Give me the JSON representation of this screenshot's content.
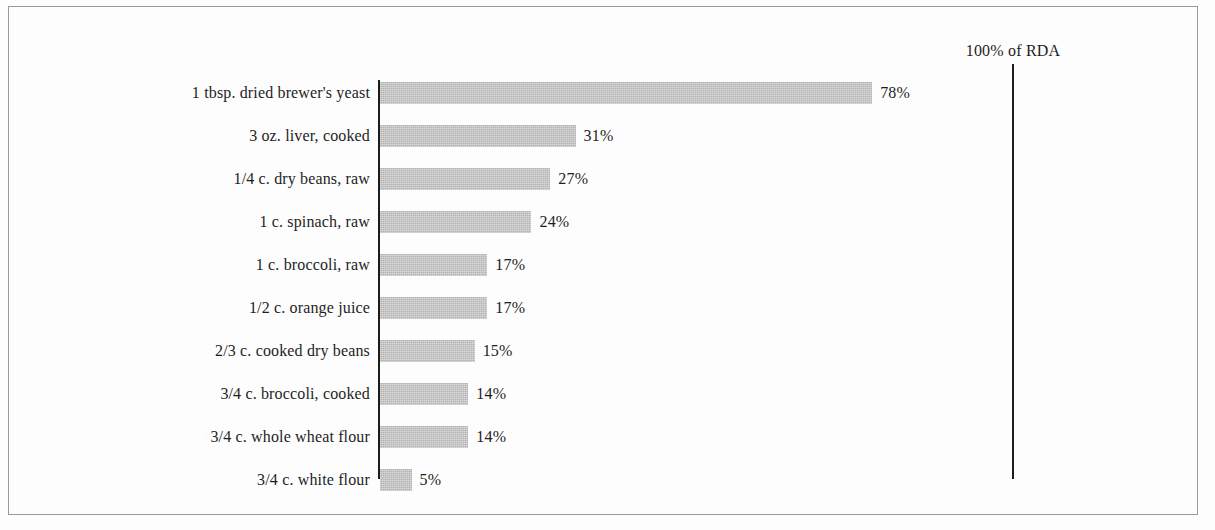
{
  "chart_data": {
    "type": "bar",
    "orientation": "horizontal",
    "title": "",
    "xlabel": "",
    "ylabel": "",
    "xlim": [
      0,
      100
    ],
    "grid": false,
    "legend": null,
    "value_suffix": "%",
    "categories": [
      "1 tbsp. dried brewer's yeast",
      "3 oz. liver, cooked",
      "1/4 c. dry beans, raw",
      "1 c. spinach, raw",
      "1 c. broccoli, raw",
      "1/2 c. orange juice",
      "2/3 c. cooked dry beans",
      "3/4 c. broccoli, cooked",
      "3/4 c. whole wheat flour",
      "3/4 c. white flour"
    ],
    "values": [
      78,
      31,
      27,
      24,
      17,
      17,
      15,
      14,
      14,
      5
    ],
    "data_labels": [
      "78%",
      "31%",
      "27%",
      "24%",
      "17%",
      "17%",
      "15%",
      "14%",
      "14%",
      "5%"
    ],
    "annotations": [
      {
        "name": "rda-reference",
        "text": "100% of RDA",
        "x_value": 100
      }
    ],
    "colors": {
      "bar": "#b5b5b5",
      "axis": "#1c1c1c",
      "text": "#1d1d1d",
      "background": "#fdfdfd",
      "frame": "#9a9a9a"
    }
  },
  "geometry": {
    "plot_left_px": 380,
    "px_per_percent": 6.31,
    "first_row_top_px": 82,
    "row_pitch_px": 43,
    "bar_height_px": 22
  }
}
